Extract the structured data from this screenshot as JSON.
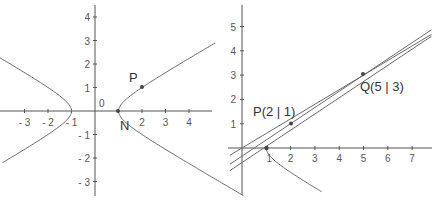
{
  "chart_data": [
    {
      "type": "line",
      "title": "",
      "description": "Hyperbola x^2 - 3y^2 = 1 with points N and P",
      "xlabel": "",
      "ylabel": "",
      "xlim": [
        -4,
        5
      ],
      "ylim": [
        -3.5,
        4.5
      ],
      "x_ticks": [
        "- 3",
        "- 2",
        "- 1",
        "2",
        "3",
        "4"
      ],
      "x_tick_values": [
        -3,
        -2,
        -1,
        2,
        3,
        4
      ],
      "y_ticks": [
        "4",
        "3",
        "2",
        "1",
        "- 1",
        "- 2",
        "- 3"
      ],
      "y_tick_values": [
        4,
        3,
        2,
        1,
        -1,
        -2,
        -3
      ],
      "origin_label": "0",
      "grid": false,
      "series": [
        {
          "name": "hyperbola",
          "equation": "x^2 - 3y^2 = 1",
          "branches": [
            "right",
            "left"
          ]
        }
      ],
      "points": [
        {
          "label": "N",
          "x": 1,
          "y": 0
        },
        {
          "label": "P",
          "x": 2,
          "y": 1
        }
      ]
    },
    {
      "type": "line",
      "title": "",
      "description": "Tangent/secant lines through P and Q near the hyperbola branch",
      "xlabel": "",
      "ylabel": "",
      "xlim": [
        -0.5,
        7.8
      ],
      "ylim": [
        -2,
        5.8
      ],
      "x_ticks": [
        "1",
        "2",
        "3",
        "4",
        "5",
        "6",
        "7"
      ],
      "x_tick_values": [
        1,
        2,
        3,
        4,
        5,
        6,
        7
      ],
      "y_ticks": [
        "5",
        "4",
        "3",
        "2",
        "1"
      ],
      "y_tick_values": [
        5,
        4,
        3,
        2,
        1
      ],
      "grid": false,
      "series": [
        {
          "name": "secant PQ",
          "slope": 0.6667,
          "intercept": -0.3333
        },
        {
          "name": "tangent at P",
          "slope": 0.6667,
          "intercept": -0.6
        },
        {
          "name": "tangent at Q",
          "slope": 0.6,
          "intercept": 0.0
        }
      ],
      "points": [
        {
          "label": "P(2 | 1)",
          "x": 2,
          "y": 1
        },
        {
          "label": "Q(5 | 3)",
          "x": 5,
          "y": 3
        },
        {
          "label": "",
          "x": 1,
          "y": 0
        }
      ]
    }
  ],
  "left": {
    "origin_label": "0",
    "x_ticks": [
      {
        "label": "- 3",
        "v": -3
      },
      {
        "label": "- 2",
        "v": -2
      },
      {
        "label": "- 1",
        "v": -1
      },
      {
        "label": "2",
        "v": 2
      },
      {
        "label": "3",
        "v": 3
      },
      {
        "label": "4",
        "v": 4
      }
    ],
    "y_ticks": [
      {
        "label": "4",
        "v": 4
      },
      {
        "label": "3",
        "v": 3
      },
      {
        "label": "2",
        "v": 2
      },
      {
        "label": "1",
        "v": 1
      },
      {
        "label": "- 1",
        "v": -1
      },
      {
        "label": "- 2",
        "v": -2
      },
      {
        "label": "- 3",
        "v": -3
      }
    ],
    "point_n_label": "N",
    "point_p_label": "P"
  },
  "right": {
    "x_ticks": [
      {
        "label": "1",
        "v": 1
      },
      {
        "label": "2",
        "v": 2
      },
      {
        "label": "3",
        "v": 3
      },
      {
        "label": "4",
        "v": 4
      },
      {
        "label": "5",
        "v": 5
      },
      {
        "label": "6",
        "v": 6
      },
      {
        "label": "7",
        "v": 7
      }
    ],
    "y_ticks": [
      {
        "label": "5",
        "v": 5
      },
      {
        "label": "4",
        "v": 4
      },
      {
        "label": "3",
        "v": 3
      },
      {
        "label": "2",
        "v": 2
      },
      {
        "label": "1",
        "v": 1
      }
    ],
    "point_p_label": "P(2 | 1)",
    "point_q_label": "Q(5 | 3)"
  },
  "colors": {
    "axis": "#555555",
    "curve": "#6a6a6a",
    "point": "#444444",
    "text": "#333333"
  }
}
